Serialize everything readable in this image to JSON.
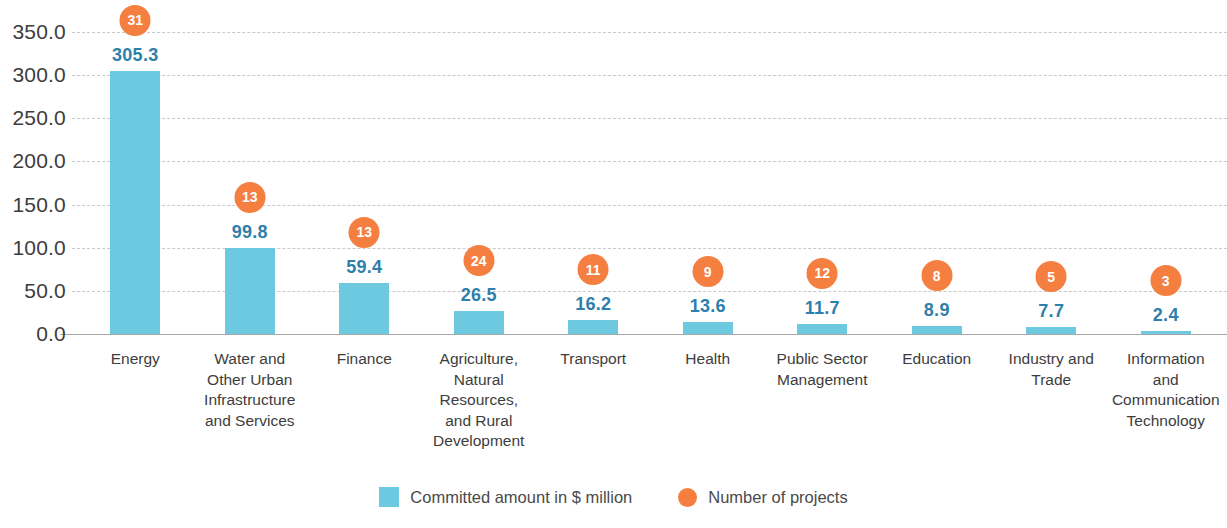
{
  "chart_data": {
    "type": "bar",
    "title": "",
    "subtitle": "",
    "xlabel": "",
    "ylabel": "",
    "ylim": [
      0,
      350
    ],
    "ytick_step": 50,
    "grid": true,
    "legend_position": "bottom",
    "categories": [
      "Energy",
      "Water and Other Urban Infrastructure and Services",
      "Finance",
      "Agriculture, Natural Resources, and Rural Development",
      "Transport",
      "Health",
      "Public Sector Management",
      "Education",
      "Industry and Trade",
      "Information and Communication Technology"
    ],
    "category_lines": [
      [
        "Energy"
      ],
      [
        "Water and",
        "Other Urban",
        "Infrastructure",
        "and Services"
      ],
      [
        "Finance"
      ],
      [
        "Agriculture,",
        "Natural",
        "Resources,",
        "and Rural",
        "Development"
      ],
      [
        "Transport"
      ],
      [
        "Health"
      ],
      [
        "Public Sector",
        "Management"
      ],
      [
        "Education"
      ],
      [
        "Industry and",
        "Trade"
      ],
      [
        "Information",
        "and",
        "Communication",
        "Technology"
      ]
    ],
    "series": [
      {
        "name": "Committed amount in $ million",
        "type": "bar",
        "color": "#6cc9e0",
        "values": [
          305.3,
          99.8,
          59.4,
          26.5,
          16.2,
          13.6,
          11.7,
          8.9,
          7.7,
          2.4
        ],
        "labels": [
          "305.3",
          "99.8",
          "59.4",
          "26.5",
          "16.2",
          "13.6",
          "11.7",
          "8.9",
          "7.7",
          "2.4"
        ]
      },
      {
        "name": "Number of projects",
        "type": "bubble-marker",
        "color": "#f47f40",
        "values": [
          31,
          13,
          13,
          24,
          11,
          9,
          12,
          8,
          5,
          3
        ],
        "labels": [
          "31",
          "13",
          "13",
          "24",
          "11",
          "9",
          "12",
          "8",
          "5",
          "3"
        ]
      }
    ],
    "ytick_labels": [
      "350.0",
      "300.0",
      "250.0",
      "200.0",
      "150.0",
      "100.0",
      "50.0",
      "0.0"
    ],
    "ytick_values": [
      350,
      300,
      250,
      200,
      150,
      100,
      50,
      0
    ]
  },
  "axis": {
    "y": {
      "ticks": [
        {
          "label": "350.0",
          "value": 350
        },
        {
          "label": "300.0",
          "value": 300
        },
        {
          "label": "250.0",
          "value": 250
        },
        {
          "label": "200.0",
          "value": 200
        },
        {
          "label": "150.0",
          "value": 150
        },
        {
          "label": "100.0",
          "value": 100
        },
        {
          "label": "50.0",
          "value": 50
        },
        {
          "label": "0.0",
          "value": 0
        }
      ]
    }
  },
  "legend": {
    "items": [
      {
        "label": "Committed amount in $ million",
        "marker": "square-swatch",
        "color": "#6cc9e0"
      },
      {
        "label": "Number of projects",
        "marker": "circle-swatch",
        "color": "#f47f40"
      }
    ]
  },
  "colors": {
    "bar": "#6cc9e0",
    "bubble": "#f47f40",
    "bar_value_text": "#2e7fab",
    "axis_text": "#3d3d3d",
    "gridline": "#c9c9c9",
    "baseline": "#a8a8a8",
    "background": "#ffffff"
  }
}
